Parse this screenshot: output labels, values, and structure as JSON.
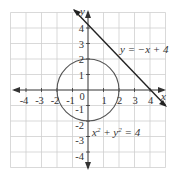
{
  "figure": {
    "x_axis_label": "x",
    "y_axis_label": "y",
    "origin_label": "0",
    "x_ticks": [
      "-4",
      "-3",
      "-2",
      "-1",
      "1",
      "2",
      "3",
      "4"
    ],
    "y_ticks": [
      "4",
      "3",
      "2",
      "1",
      "-1",
      "-2",
      "-3",
      "-4"
    ],
    "line_label": "y = −x + 4",
    "circle_label_base": "x",
    "circle_label_sup1": "2",
    "circle_label_mid": " + y",
    "circle_label_sup2": "2",
    "circle_label_end": " = 4",
    "colors": {
      "grid": "#c8c8c8",
      "axis": "#333333",
      "line": "#222222",
      "circle": "#555555",
      "background": "#ffffff"
    }
  }
}
